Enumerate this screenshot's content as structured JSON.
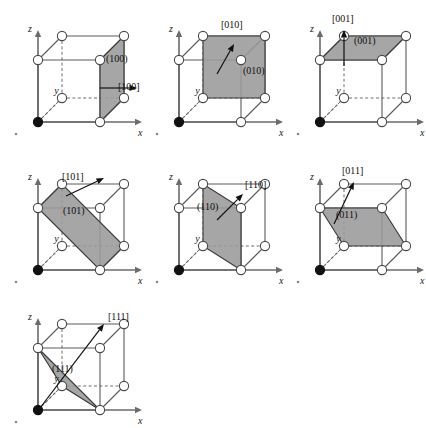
{
  "figure": {
    "colors": {
      "plane_fill": "#9a9a9a",
      "plane_stroke": "#3a3a3a",
      "cube_edge": "#5a5a5a",
      "hidden_edge": "#6e6e6e",
      "atom_fill": "#ffffff",
      "atom_stroke": "#4a4a4a",
      "origin_atom_fill": "#111111",
      "axis_color": "#6b6b6b",
      "arrow_color": "#111111",
      "text_color": "#111111",
      "background": "#ffffff"
    },
    "axes": {
      "x_label": "x",
      "y_label": "y",
      "z_label": "z"
    },
    "geometry": {
      "origin": [
        38,
        122
      ],
      "x_unit": [
        62,
        0
      ],
      "y_unit": [
        24,
        -24
      ],
      "z_unit": [
        0,
        -62
      ],
      "atom_radius": 4.6,
      "origin_atom_radius": 4.6
    },
    "panels": [
      {
        "id": "panel-100",
        "row": 0,
        "col": 0,
        "left": 0,
        "top": 0,
        "plane_label": "(100)",
        "direction_label": "[100]",
        "plane_name": "plane-100",
        "direction_name": "direction-100",
        "plane_vertices": [
          [
            1,
            0,
            0
          ],
          [
            1,
            1,
            0
          ],
          [
            1,
            1,
            1
          ],
          [
            1,
            0,
            1
          ]
        ],
        "plane_label_pos": [
          106,
          62
        ],
        "direction_label_pos": [
          118,
          90
        ],
        "arrow": {
          "from": [
            100,
            88
          ],
          "to": [
            137,
            88
          ]
        }
      },
      {
        "id": "panel-010",
        "row": 0,
        "col": 1,
        "left": 141,
        "top": 0,
        "plane_label": "(010)",
        "direction_label": "[010]",
        "plane_name": "plane-010",
        "direction_name": "direction-010",
        "plane_vertices": [
          [
            0,
            1,
            0
          ],
          [
            1,
            1,
            0
          ],
          [
            1,
            1,
            1
          ],
          [
            0,
            1,
            1
          ]
        ],
        "plane_label_pos": [
          102,
          74
        ],
        "direction_label_pos": [
          80,
          28
        ],
        "arrow": {
          "from": [
            76,
            74
          ],
          "to": [
            93,
            44
          ]
        }
      },
      {
        "id": "panel-001",
        "row": 0,
        "col": 2,
        "left": 282,
        "top": 0,
        "plane_label": "(001)",
        "direction_label": "[001]",
        "plane_name": "plane-001",
        "direction_name": "direction-001",
        "plane_vertices": [
          [
            0,
            0,
            1
          ],
          [
            1,
            0,
            1
          ],
          [
            1,
            1,
            1
          ],
          [
            0,
            1,
            1
          ]
        ],
        "plane_label_pos": [
          72,
          44
        ],
        "direction_label_pos": [
          50,
          22
        ],
        "arrow": {
          "from": [
            62,
            66
          ],
          "to": [
            62,
            30
          ]
        }
      },
      {
        "id": "panel-101",
        "row": 1,
        "col": 0,
        "left": 0,
        "top": 148,
        "plane_label": "(101)",
        "direction_label": "[101]",
        "plane_name": "plane-101",
        "direction_name": "direction-101",
        "plane_vertices": [
          [
            0,
            0,
            1
          ],
          [
            1,
            0,
            0
          ],
          [
            1,
            1,
            0
          ],
          [
            0,
            1,
            1
          ]
        ],
        "plane_label_pos": [
          63,
          66
        ],
        "direction_label_pos": [
          62,
          32
        ],
        "arrow": {
          "from": [
            66,
            48
          ],
          "to": [
            104,
            30
          ]
        }
      },
      {
        "id": "panel-110",
        "row": 1,
        "col": 1,
        "left": 141,
        "top": 148,
        "plane_label": "(110)",
        "direction_label": "[110]",
        "plane_name": "plane-110",
        "direction_name": "direction-110",
        "plane_vertices": [
          [
            1,
            0,
            0
          ],
          [
            0,
            1,
            0
          ],
          [
            0,
            1,
            1
          ],
          [
            1,
            0,
            1
          ]
        ],
        "plane_label_pos": [
          56,
          62
        ],
        "direction_label_pos": [
          104,
          40
        ],
        "arrow": {
          "from": [
            76,
            72
          ],
          "to": [
            102,
            46
          ]
        }
      },
      {
        "id": "panel-011",
        "row": 1,
        "col": 2,
        "left": 282,
        "top": 148,
        "plane_label": "(011)",
        "direction_label": "[011]",
        "plane_name": "plane-011",
        "direction_name": "direction-011",
        "plane_vertices": [
          [
            0,
            0,
            1
          ],
          [
            1,
            0,
            1
          ],
          [
            1,
            1,
            0
          ],
          [
            0,
            1,
            0
          ]
        ],
        "plane_label_pos": [
          54,
          70
        ],
        "direction_label_pos": [
          60,
          26
        ],
        "arrow": {
          "from": [
            52,
            76
          ],
          "to": [
            72,
            34
          ]
        }
      },
      {
        "id": "panel-111",
        "row": 2,
        "col": 0,
        "left": 0,
        "top": 288,
        "plane_label": "(111)",
        "direction_label": "[111]",
        "plane_name": "plane-111",
        "direction_name": "direction-111",
        "plane_vertices": [
          [
            1,
            0,
            0
          ],
          [
            0,
            1,
            0
          ],
          [
            0,
            0,
            1
          ]
        ],
        "plane_label_pos": [
          52,
          84
        ],
        "direction_label_pos": [
          108,
          32
        ],
        "arrow": {
          "from": [
            40,
            120
          ],
          "to": [
            104,
            36
          ]
        }
      }
    ]
  }
}
